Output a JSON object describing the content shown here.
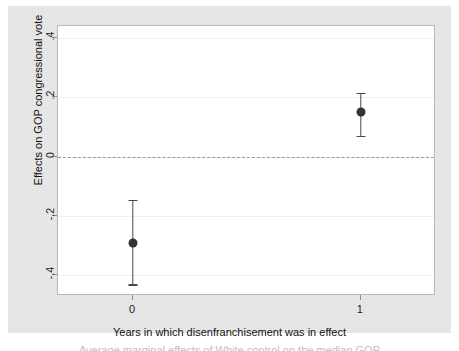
{
  "figure": {
    "background_color": "#e9e9e9",
    "plot_background_color": "#ffffff",
    "frame_color": "#b9b9b9",
    "marker_color": "#333333",
    "whisker_color": "#4a4a4a",
    "zero_line_color": "#9a9a9a",
    "gridline_color": "#efefef",
    "caption_partial": "Average marginal effects of White control on the median GOP"
  },
  "chart_data": {
    "type": "scatter",
    "title": "",
    "subtitle": "",
    "xlabel": "Years in which disenfranchisement was in effect",
    "ylabel": "Effects on GOP congressional vote",
    "x": [
      0,
      1
    ],
    "categories": [
      "0",
      "1"
    ],
    "xtick_labels": [
      "0",
      "1"
    ],
    "ytick_labels": [
      ".4",
      ".2",
      "0",
      "-.2",
      "-.4"
    ],
    "ytick_values": [
      0.4,
      0.2,
      0,
      -0.2,
      -0.4
    ],
    "xlim": [
      -0.33,
      1.33
    ],
    "ylim": [
      -0.47,
      0.44
    ],
    "grid": true,
    "legend": "none",
    "reference_line": {
      "y": 0,
      "style": "dashed"
    },
    "series": [
      {
        "name": "Average marginal effect",
        "values": [
          -0.29,
          0.15
        ],
        "ci_low": [
          -0.43,
          0.07
        ],
        "ci_high": [
          -0.145,
          0.215
        ],
        "marker": "filled-circle"
      }
    ],
    "annotations": []
  }
}
